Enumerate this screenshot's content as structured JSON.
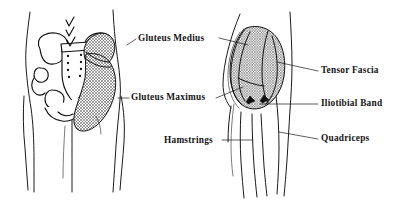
{
  "figure": {
    "background_color": "#ffffff",
    "ink_color": "#111111",
    "width": 409,
    "height": 200
  },
  "labels": [
    {
      "id": "gluteus-medius",
      "text": "Gluteus Medius",
      "align": "left",
      "x": 138,
      "y": 41
    },
    {
      "id": "gluteus-maximus",
      "text": "Gluteus Maximus",
      "align": "left",
      "x": 131,
      "y": 100
    },
    {
      "id": "hamstrings",
      "text": "Hamstrings",
      "align": "left",
      "x": 164,
      "y": 143
    },
    {
      "id": "tensor-fascia",
      "text": "Tensor Fascia",
      "align": "left",
      "x": 321,
      "y": 73
    },
    {
      "id": "iliotibial-band",
      "text": "Iliotibial Band",
      "align": "left",
      "x": 321,
      "y": 106
    },
    {
      "id": "quadriceps",
      "text": "Quadriceps",
      "align": "left",
      "x": 321,
      "y": 141
    }
  ],
  "views": [
    {
      "id": "posterior-pelvis-view",
      "name": "Posterior pelvis and gluteal view",
      "position": "left"
    },
    {
      "id": "lateral-hip-view",
      "name": "Lateral hip and thigh view",
      "position": "right"
    }
  ],
  "annotations": {
    "spine_chevrons": {
      "name": "lumbar-spine-chevrons",
      "count": 3,
      "description": "Three downward chevron marks pointing at the lumbar spine"
    },
    "arrow_markers": {
      "name": "greater-trochanter-arrowheads",
      "count": 2,
      "description": "Two solid arrowhead markers at the lower gluteal border"
    }
  }
}
